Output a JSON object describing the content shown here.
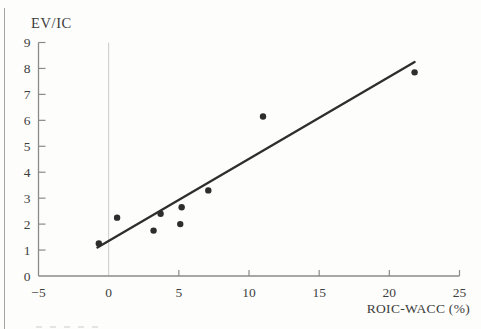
{
  "chart_data": {
    "type": "scatter",
    "title": "",
    "ylabel": "EV/IC",
    "xlabel": "ROIC-WACC (%)",
    "xlim": [
      -5,
      25
    ],
    "ylim": [
      0,
      9
    ],
    "x_ticks": [
      -5,
      0,
      5,
      10,
      15,
      20,
      25
    ],
    "x_tick_labels": [
      "−5",
      "0",
      "5",
      "10",
      "15",
      "20",
      "25"
    ],
    "y_ticks": [
      0,
      1,
      2,
      3,
      4,
      5,
      6,
      7,
      8,
      9
    ],
    "y_tick_labels": [
      "0",
      "1",
      "2",
      "3",
      "4",
      "5",
      "6",
      "7",
      "8",
      "9"
    ],
    "gridline_x": 0,
    "points": [
      {
        "x": -0.7,
        "y": 1.25
      },
      {
        "x": 0.6,
        "y": 2.25
      },
      {
        "x": 3.2,
        "y": 1.75
      },
      {
        "x": 3.7,
        "y": 2.4
      },
      {
        "x": 5.1,
        "y": 2.0
      },
      {
        "x": 5.2,
        "y": 2.65
      },
      {
        "x": 7.1,
        "y": 3.3
      },
      {
        "x": 11.0,
        "y": 6.15
      },
      {
        "x": 21.8,
        "y": 7.85
      }
    ],
    "trendline": {
      "x1": -0.8,
      "y1": 1.1,
      "x2": 21.8,
      "y2": 8.25
    },
    "colors": {
      "point": "#2d2d2d",
      "line": "#2e2e2e",
      "axis": "#8a8a8a",
      "gridline": "#cbcbc9",
      "text": "#3f3f3f"
    }
  }
}
